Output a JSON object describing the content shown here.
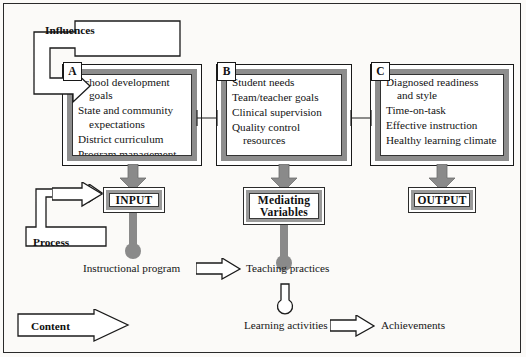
{
  "diagram": {
    "title_visible": false,
    "colors": {
      "page_background": "#fbfaf8",
      "box_border_gray": "#8d8d8d",
      "arrow_gray": "#8a8a8a",
      "outline_black": "#1a1a1a",
      "text": "#131313"
    },
    "labels": {
      "influences": "Influences",
      "process": "Process",
      "content": "Content"
    },
    "boxes": [
      {
        "tag": "A",
        "items": [
          {
            "line1": "School development",
            "line2": "goals"
          },
          {
            "line1": "State and community",
            "line2": "expectations"
          },
          {
            "line1": "District curriculum",
            "line2": ""
          },
          {
            "line1": "Program management",
            "line2": ""
          }
        ]
      },
      {
        "tag": "B",
        "items": [
          {
            "line1": "Student needs",
            "line2": ""
          },
          {
            "line1": "Team/teacher goals",
            "line2": ""
          },
          {
            "line1": "Clinical supervision",
            "line2": ""
          },
          {
            "line1": "Quality control",
            "line2": "resources"
          }
        ]
      },
      {
        "tag": "C",
        "items": [
          {
            "line1": "Diagnosed readiness",
            "line2": "and style"
          },
          {
            "line1": "Time-on-task",
            "line2": ""
          },
          {
            "line1": "Effective instruction",
            "line2": ""
          },
          {
            "line1": "Healthy learning climate",
            "line2": ""
          }
        ]
      }
    ],
    "results": [
      {
        "name": "input",
        "label": "INPUT"
      },
      {
        "name": "mediating-variables",
        "label_line1": "Mediating",
        "label_line2": "Variables"
      },
      {
        "name": "output",
        "label": "OUTPUT"
      }
    ],
    "captions": {
      "instructional_program": "Instructional program",
      "teaching_practices": "Teaching practices",
      "learning_activities": "Learning activities",
      "achievements": "Achievements"
    }
  }
}
